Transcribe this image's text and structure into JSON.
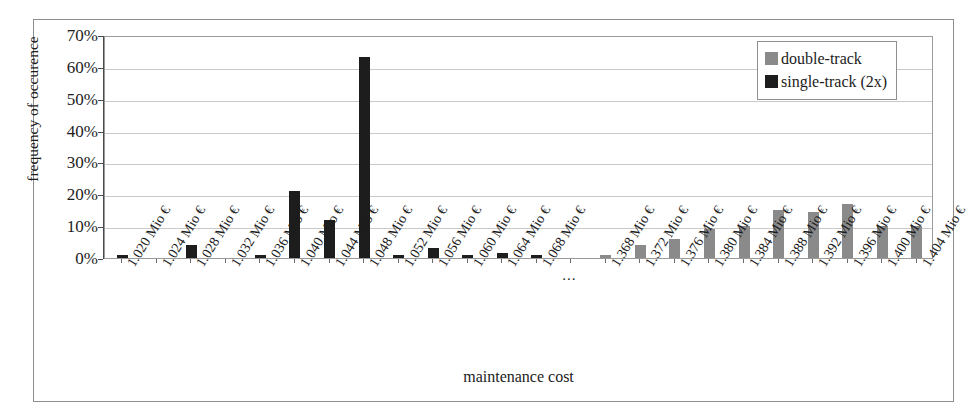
{
  "chart_data": {
    "type": "bar",
    "title": "",
    "xlabel": "maintenance cost",
    "ylabel": "frequency of occurence",
    "ylim": [
      0,
      70
    ],
    "ytick_labels": [
      "70%",
      "60%",
      "50%",
      "40%",
      "30%",
      "20%",
      "10%",
      "0%"
    ],
    "ytick_values": [
      70,
      60,
      50,
      40,
      30,
      20,
      10,
      0
    ],
    "grid": true,
    "legend_position": "top-right",
    "axis_break_label": "...",
    "categories": [
      "1.020 Mio €",
      "1.024 Mio €",
      "1.028 Mio €",
      "1.032 Mio €",
      "1.036 Mio €",
      "1.040 Mio €",
      "1.044 Mio €",
      "1.048 Mio €",
      "1.052 Mio €",
      "1.056 Mio €",
      "1.060 Mio €",
      "1.064 Mio €",
      "1.068 Mio €",
      "...",
      "1.368 Mio €",
      "1.372 Mio €",
      "1.376 Mio €",
      "1.380 Mio €",
      "1.384 Mio €",
      "1.388 Mio €",
      "1.392 Mio €",
      "1.396 Mio €",
      "1.400 Mio €",
      "1.404 Mio €"
    ],
    "series": [
      {
        "name": "single-track (2x)",
        "color": "#1d1d1d",
        "values": [
          1,
          0,
          4,
          0,
          1,
          21,
          12,
          63,
          1,
          3,
          1,
          1.5,
          1,
          null,
          null,
          null,
          null,
          null,
          null,
          null,
          null,
          null,
          null,
          null
        ]
      },
      {
        "name": "double-track",
        "color": "#8a8a8a",
        "values": [
          null,
          null,
          null,
          null,
          null,
          null,
          null,
          null,
          null,
          null,
          null,
          null,
          null,
          null,
          1,
          4,
          6,
          9,
          10,
          15,
          14.5,
          17,
          10,
          10
        ]
      }
    ],
    "note_extra_double_track_tail": [
      8,
      4,
      2,
      1,
      1,
      1
    ]
  },
  "legend": {
    "items": [
      {
        "label": "double-track",
        "color": "#8a8a8a"
      },
      {
        "label": "single-track (2x)",
        "color": "#1d1d1d"
      }
    ]
  },
  "axes": {
    "y_title": "frequency of occurence",
    "x_title": "maintenance cost"
  }
}
